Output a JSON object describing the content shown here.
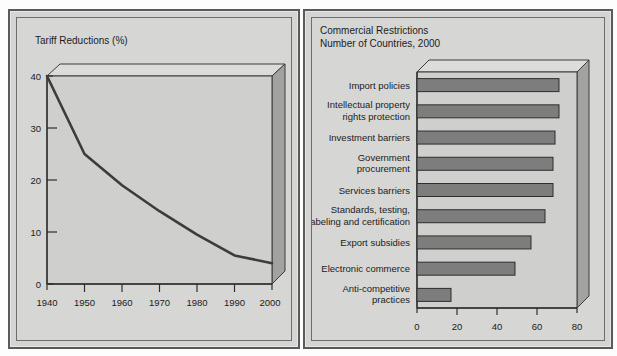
{
  "figure": {
    "panels": [
      "tariff-reductions",
      "commercial-restrictions"
    ]
  },
  "left": {
    "title": "Tariff Reductions (%)"
  },
  "right": {
    "title_line1": "Commercial Restrictions",
    "title_line2": "Number of Countries, 2000"
  },
  "chart_data": [
    {
      "type": "line",
      "id": "tariff-reductions",
      "title": "Tariff Reductions (%)",
      "xlabel": "",
      "ylabel": "",
      "x": [
        1940,
        1950,
        1960,
        1970,
        1980,
        1990,
        2000
      ],
      "values": [
        40,
        25,
        19,
        14,
        9.5,
        5.5,
        4
      ],
      "xticklabels": [
        "1940",
        "1950",
        "1960",
        "1970",
        "1980",
        "1990",
        "2000"
      ],
      "yticklabels": [
        "0",
        "10",
        "20",
        "30",
        "40"
      ],
      "yticks": [
        0,
        10,
        20,
        30,
        40
      ],
      "xlim": [
        1940,
        2000
      ],
      "ylim": [
        0,
        40
      ],
      "grid": false,
      "legend": "none",
      "style": "3d-wall-backdrop",
      "line_color": "#3c3c3c"
    },
    {
      "type": "bar",
      "id": "commercial-restrictions",
      "orientation": "horizontal",
      "title": "Commercial Restrictions",
      "subtitle": "Number of Countries, 2000",
      "xlabel": "",
      "ylabel": "",
      "categories": [
        "Import policies",
        "Intellectual property\nrights protection",
        "Investment barriers",
        "Government\nprocurement",
        "Services barriers",
        "Standards, testing,\nlabeling and certification",
        "Export subsidies",
        "Electronic commerce",
        "Anti-competitive\npractices"
      ],
      "values": [
        71,
        71,
        69,
        68,
        68,
        64,
        57,
        49,
        17
      ],
      "xticks": [
        0,
        20,
        40,
        60,
        80
      ],
      "xticklabels": [
        "0",
        "20",
        "40",
        "60",
        "80"
      ],
      "xlim": [
        0,
        80
      ],
      "grid": false,
      "legend": "none",
      "style": "3d-wall-backdrop",
      "bar_color": "#7d7d7d"
    }
  ],
  "colors": {
    "panel_background": "#d4d4d2",
    "panel_border": "#5a5a5a",
    "plot_face": "#cfcfcd",
    "plot_top_face": "#dcdcda",
    "plot_side_face": "#a9a9a7",
    "bar_fill": "#7d7d7d",
    "line_stroke": "#3c3c3c",
    "axis_stroke": "#2e2e2e",
    "text": "#1c1c1c"
  }
}
